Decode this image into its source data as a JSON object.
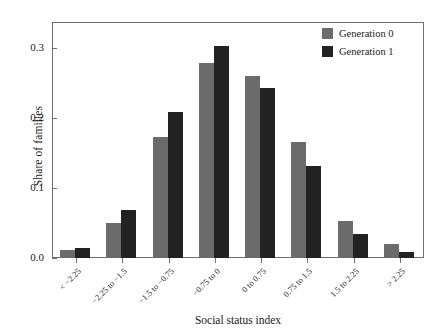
{
  "chart_data": {
    "type": "bar",
    "title": "",
    "xlabel": "Social status index",
    "ylabel": "Share of families",
    "categories": [
      "< −2.25",
      "−2.25 to −1.5",
      "−1.5 to −0.75",
      "−0.75 to 0",
      "0 to 0.75",
      "0.75 to 1.5",
      "1.5 to 2.25",
      "> 2.25"
    ],
    "series": [
      {
        "name": "Generation 0",
        "color": "#6b6b6b",
        "values": [
          0.011,
          0.05,
          0.173,
          0.278,
          0.259,
          0.166,
          0.053,
          0.02
        ]
      },
      {
        "name": "Generation 1",
        "color": "#222222",
        "values": [
          0.014,
          0.068,
          0.208,
          0.302,
          0.243,
          0.131,
          0.034,
          0.008
        ]
      }
    ],
    "ylim": [
      0.0,
      0.335
    ],
    "yticks": [
      0.0,
      0.1,
      0.2,
      0.3
    ],
    "ytick_labels": [
      "0.0",
      "0.1",
      "0.2",
      "0.3"
    ],
    "grid": false,
    "legend_position": "top-right",
    "frame": true
  }
}
